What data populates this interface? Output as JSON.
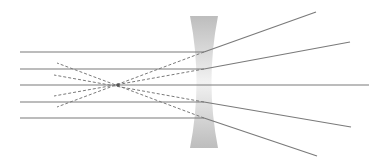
{
  "diagram": {
    "title": "Diverging (concave) lens ray diagram",
    "colors": {
      "ray": "#7a7a7a",
      "virtual_ray": "#7a7a7a",
      "lens_edge": "#bdbdbd",
      "lens_center": "#f2f2f2",
      "background": "#ffffff",
      "focal_point": "#555555"
    },
    "lens": {
      "type": "concave",
      "x_left": 190,
      "x_right": 218,
      "y_top": 16,
      "y_bottom": 148,
      "waist_half_width": 3
    },
    "focal_point": {
      "x": 118,
      "y": 85
    },
    "incident_rays": [
      {
        "y": 52,
        "x_start": 20,
        "x_end": 204
      },
      {
        "y": 69,
        "x_start": 20,
        "x_end": 204
      },
      {
        "y": 85,
        "x_start": 20,
        "x_end": 204
      },
      {
        "y": 102,
        "x_start": 20,
        "x_end": 204
      },
      {
        "y": 118,
        "x_start": 20,
        "x_end": 204
      }
    ],
    "refracted_rays": [
      {
        "x1": 204,
        "y1": 52,
        "x2": 316,
        "y2": 12
      },
      {
        "x1": 204,
        "y1": 69,
        "x2": 350,
        "y2": 42
      },
      {
        "x1": 204,
        "y1": 85,
        "x2": 369,
        "y2": 85
      },
      {
        "x1": 204,
        "y1": 102,
        "x2": 351,
        "y2": 127
      },
      {
        "x1": 204,
        "y1": 118,
        "x2": 317,
        "y2": 156
      }
    ],
    "virtual_rays": [
      {
        "x1": 204,
        "y1": 52,
        "x2": 57,
        "y2": 107
      },
      {
        "x1": 204,
        "y1": 69,
        "x2": 54,
        "y2": 96
      },
      {
        "x1": 204,
        "y1": 102,
        "x2": 54,
        "y2": 75
      },
      {
        "x1": 204,
        "y1": 118,
        "x2": 57,
        "y2": 63
      }
    ]
  }
}
